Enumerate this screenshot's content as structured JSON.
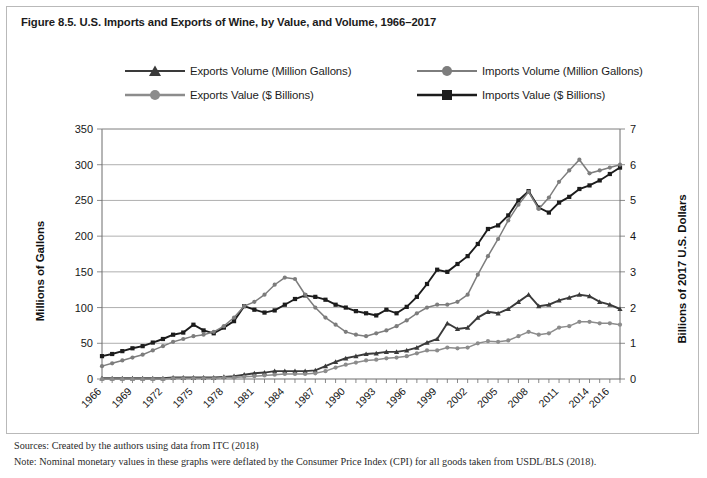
{
  "figure": {
    "title": "Figure 8.5. U.S. Imports and Exports of Wine, by Value, and Volume, 1966–2017",
    "sources_note": "Sources: Created by the authors using data from ITC (2018)",
    "method_note": "Note: Nominal monetary values in these graphs were deflated by the Consumer Price Index (CPI) for all goods taken from USDL/BLS (2018)."
  },
  "colors": {
    "exports_volume": "#3a3a3a",
    "imports_volume": "#7d7d7d",
    "exports_value": "#8c8c8c",
    "imports_value": "#1c1c1c",
    "grid": "#9a9a9a",
    "frame": "#b9b9b9",
    "text": "#1b1b1b"
  },
  "legend": {
    "items": [
      {
        "label": "Exports Volume (Million Gallons)",
        "marker": "triangle",
        "color": "#3a3a3a"
      },
      {
        "label": "Imports Volume (Million Gallons)",
        "marker": "circle",
        "color": "#7d7d7d"
      },
      {
        "label": "Exports Value ($ Billions)",
        "marker": "circle",
        "color": "#8c8c8c"
      },
      {
        "label": "Imports Value ($ Billions)",
        "marker": "square",
        "color": "#1c1c1c"
      }
    ]
  },
  "chart_data": {
    "type": "line",
    "title": "Figure 8.5. U.S. Imports and Exports of Wine, by Value, and Volume, 1966–2017",
    "xlabel": "",
    "ylabel": "Millions of Gallons",
    "y2label": "Billions of 2017 U.S. Dollars",
    "ylim": [
      0,
      350
    ],
    "y2lim": [
      0,
      7
    ],
    "yticks": [
      0,
      50,
      100,
      150,
      200,
      250,
      300,
      350
    ],
    "y2ticks": [
      0,
      1,
      2,
      3,
      4,
      5,
      6,
      7
    ],
    "grid": true,
    "legend_position": "top",
    "x": [
      1966,
      1967,
      1968,
      1969,
      1970,
      1971,
      1972,
      1973,
      1974,
      1975,
      1976,
      1977,
      1978,
      1979,
      1980,
      1981,
      1982,
      1983,
      1984,
      1985,
      1986,
      1987,
      1988,
      1989,
      1990,
      1991,
      1992,
      1993,
      1994,
      1995,
      1996,
      1997,
      1998,
      1999,
      2000,
      2001,
      2002,
      2003,
      2004,
      2005,
      2006,
      2007,
      2008,
      2009,
      2010,
      2011,
      2012,
      2013,
      2014,
      2015,
      2016,
      2017
    ],
    "xtick_labels": [
      "1966",
      "1969",
      "1972",
      "1975",
      "1978",
      "1981",
      "1984",
      "1987",
      "1990",
      "1993",
      "1996",
      "1999",
      "2002",
      "2005",
      "2008",
      "2011",
      "2014",
      "2016"
    ],
    "series": [
      {
        "name": "Imports Value ($ Billions)",
        "axis": "right",
        "marker": "square",
        "color": "#1c1c1c",
        "units": "Billions of 2017 U.S. Dollars",
        "values": [
          0.64,
          0.7,
          0.78,
          0.86,
          0.92,
          1.02,
          1.12,
          1.24,
          1.3,
          1.52,
          1.36,
          1.28,
          1.44,
          1.62,
          2.04,
          1.94,
          1.86,
          1.92,
          2.08,
          2.24,
          2.34,
          2.3,
          2.22,
          2.08,
          2.0,
          1.9,
          1.84,
          1.78,
          1.94,
          1.84,
          2.02,
          2.3,
          2.66,
          3.06,
          3.0,
          3.22,
          3.44,
          3.78,
          4.2,
          4.3,
          4.58,
          5.0,
          5.26,
          4.8,
          4.66,
          4.94,
          5.1,
          5.32,
          5.42,
          5.56,
          5.74,
          5.92
        ]
      },
      {
        "name": "Imports Volume (Million Gallons)",
        "axis": "left",
        "marker": "circle",
        "color": "#7d7d7d",
        "units": "Millions of Gallons",
        "values": [
          18,
          22,
          26,
          30,
          34,
          40,
          46,
          52,
          56,
          60,
          62,
          66,
          74,
          86,
          102,
          108,
          118,
          132,
          142,
          140,
          118,
          100,
          86,
          76,
          66,
          62,
          60,
          64,
          68,
          74,
          82,
          92,
          100,
          104,
          104,
          108,
          118,
          146,
          172,
          196,
          222,
          244,
          262,
          238,
          254,
          276,
          292,
          307,
          288,
          292,
          296,
          300
        ]
      },
      {
        "name": "Exports Volume (Million Gallons)",
        "axis": "left",
        "marker": "triangle",
        "color": "#3a3a3a",
        "units": "Millions of Gallons",
        "values": [
          1,
          1,
          1,
          1,
          1,
          1,
          1,
          2,
          2,
          2,
          2,
          2,
          3,
          4,
          6,
          8,
          9,
          11,
          11,
          11,
          11,
          12,
          18,
          24,
          29,
          32,
          35,
          36,
          38,
          38,
          40,
          44,
          51,
          56,
          78,
          70,
          72,
          86,
          94,
          92,
          98,
          108,
          118,
          102,
          104,
          110,
          114,
          118,
          116,
          108,
          104,
          98
        ]
      },
      {
        "name": "Exports Value ($ Billions)",
        "axis": "left",
        "marker": "circle",
        "color": "#8c8c8c",
        "units": "Millions of Gallons (scaled)",
        "values": [
          0,
          0,
          0,
          0,
          0,
          0,
          0,
          1,
          1,
          1,
          1,
          1,
          2,
          2,
          3,
          4,
          5,
          6,
          7,
          7,
          7,
          8,
          11,
          16,
          20,
          23,
          26,
          27,
          29,
          30,
          32,
          36,
          40,
          40,
          44,
          43,
          44,
          50,
          53,
          52,
          54,
          60,
          66,
          62,
          64,
          72,
          74,
          80,
          80,
          78,
          78,
          76
        ]
      }
    ]
  }
}
